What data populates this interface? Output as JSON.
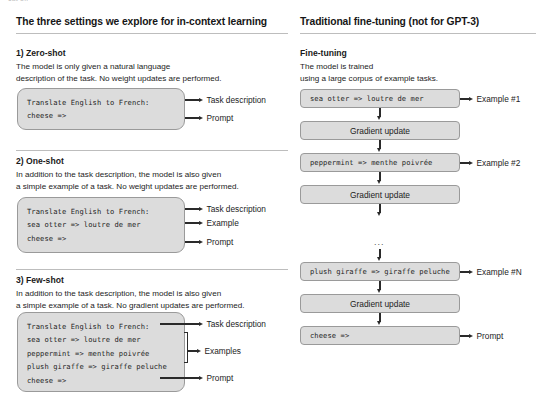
{
  "top_cutoff_text": "cut off",
  "colors": {
    "box_fill": "#dcdcdc",
    "box_border": "#9a9a9a",
    "arrow": "#2a2a2a",
    "rule": "#bdbdbd",
    "text": "#1a1a1a"
  },
  "left_column": {
    "title": "The three settings we explore for in-context learning",
    "sections": [
      {
        "heading": "1) Zero-shot",
        "body": "The model is only given a natural language\ndescription of the task. No weight updates are performed.",
        "code_lines": [
          "Translate English to French:",
          "cheese =>"
        ],
        "annotations": [
          {
            "label": "Task description"
          },
          {
            "label": "Prompt"
          }
        ]
      },
      {
        "heading": "2) One-shot",
        "body": "In addition to the task description, the model is also given\na simple example of a task. No weight updates are performed.",
        "code_lines": [
          "Translate English to French:",
          "sea otter => loutre de mer",
          "cheese =>"
        ],
        "annotations": [
          {
            "label": "Task description"
          },
          {
            "label": "Example"
          },
          {
            "label": "Prompt"
          }
        ]
      },
      {
        "heading": "3) Few-shot",
        "body": "In addition to the task description, the model is also given\na simple example of a task. No gradient updates are performed.",
        "code_lines": [
          "Translate English to French:",
          "sea otter => loutre de mer",
          "peppermint => menthe poivrée",
          "plush giraffe => giraffe peluche",
          "cheese =>"
        ],
        "annotations": [
          {
            "label": "Task description"
          },
          {
            "label": "Examples"
          },
          {
            "label": "Prompt"
          }
        ]
      }
    ]
  },
  "right_column": {
    "title_bold": "Traditional fine-tuning",
    "title_regular": "(not for GPT-3)",
    "heading": "Fine-tuning",
    "body": "The model is trained\nusing a large corpus of example tasks.",
    "flow": [
      {
        "kind": "code",
        "text": "sea otter => loutre de mer",
        "label": "Example #1"
      },
      {
        "kind": "step",
        "text": "Gradient update",
        "label": ""
      },
      {
        "kind": "code",
        "text": "peppermint => menthe poivrée",
        "label": "Example #2"
      },
      {
        "kind": "step",
        "text": "Gradient update",
        "label": ""
      },
      {
        "kind": "ellipsis",
        "text": "...",
        "label": ""
      },
      {
        "kind": "code",
        "text": "plush giraffe => giraffe peluche",
        "label": "Example #N"
      },
      {
        "kind": "step",
        "text": "Gradient update",
        "label": ""
      },
      {
        "kind": "code",
        "text": "cheese =>",
        "label": "Prompt"
      }
    ]
  }
}
